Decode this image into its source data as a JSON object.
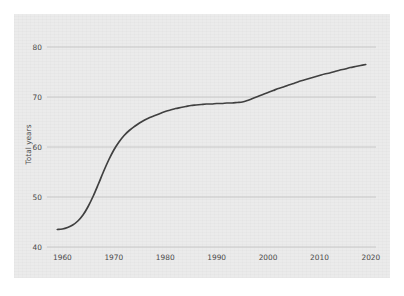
{
  "card": {
    "background_color": "#ebebeb",
    "page_background_color": "#ffffff"
  },
  "chart_data": {
    "type": "line",
    "title": "",
    "subtitle": "",
    "xlabel": "",
    "ylabel": "Total years",
    "xlim": [
      1957,
      2021
    ],
    "ylim": [
      40,
      81
    ],
    "grid": true,
    "grid_axis": "y",
    "legend": false,
    "legend_position": "none",
    "line_color": "#404040",
    "grid_color": "#bfbfbf",
    "tick_label_color": "#4a4a4a",
    "yticks": [
      40,
      50,
      60,
      70,
      80
    ],
    "ytick_labels": [
      "40",
      "50",
      "60",
      "70",
      "80"
    ],
    "xticks": [
      1960,
      1970,
      1980,
      1990,
      2000,
      2010,
      2020
    ],
    "xtick_labels": [
      "1960",
      "1970",
      "1980",
      "1990",
      "2000",
      "2010",
      "2020"
    ],
    "series": [
      {
        "name": "Total years",
        "x": [
          1959,
          1960,
          1961,
          1962,
          1963,
          1964,
          1965,
          1966,
          1967,
          1968,
          1969,
          1970,
          1971,
          1972,
          1973,
          1974,
          1975,
          1976,
          1977,
          1978,
          1979,
          1980,
          1981,
          1982,
          1983,
          1984,
          1985,
          1986,
          1987,
          1988,
          1989,
          1990,
          1991,
          1992,
          1993,
          1994,
          1995,
          1996,
          1997,
          1998,
          1999,
          2000,
          2001,
          2002,
          2003,
          2004,
          2005,
          2006,
          2007,
          2008,
          2009,
          2010,
          2011,
          2012,
          2013,
          2014,
          2015,
          2016,
          2017,
          2018,
          2019
        ],
        "values": [
          43.5,
          43.6,
          43.9,
          44.4,
          45.2,
          46.4,
          48.1,
          50.2,
          52.6,
          55.1,
          57.4,
          59.4,
          61.0,
          62.3,
          63.3,
          64.1,
          64.8,
          65.4,
          65.9,
          66.3,
          66.7,
          67.1,
          67.4,
          67.7,
          67.9,
          68.1,
          68.3,
          68.4,
          68.5,
          68.6,
          68.6,
          68.7,
          68.7,
          68.8,
          68.8,
          68.9,
          69.0,
          69.3,
          69.7,
          70.1,
          70.5,
          70.9,
          71.3,
          71.7,
          72.0,
          72.4,
          72.7,
          73.1,
          73.4,
          73.7,
          74.0,
          74.3,
          74.6,
          74.8,
          75.1,
          75.4,
          75.6,
          75.9,
          76.1,
          76.3,
          76.5
        ]
      }
    ],
    "annotations": []
  }
}
